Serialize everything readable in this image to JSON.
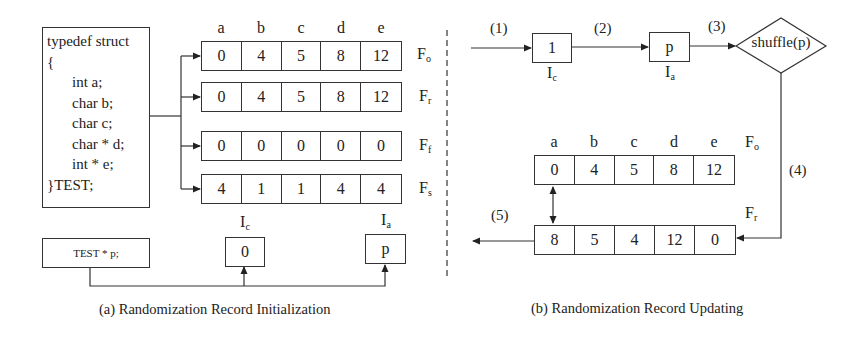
{
  "panel_a": {
    "struct_code": [
      "typedef struct",
      "{",
      "int a;",
      "char b;",
      "char c;",
      "char * d;",
      "int * e;",
      "}TEST;"
    ],
    "column_labels": [
      "a",
      "b",
      "c",
      "d",
      "e"
    ],
    "records": [
      {
        "name": "F",
        "sub": "o",
        "values": [
          "0",
          "4",
          "5",
          "8",
          "12"
        ]
      },
      {
        "name": "F",
        "sub": "r",
        "values": [
          "0",
          "4",
          "5",
          "8",
          "12"
        ]
      },
      {
        "name": "F",
        "sub": "f",
        "values": [
          "0",
          "0",
          "0",
          "0",
          "0"
        ]
      },
      {
        "name": "F",
        "sub": "s",
        "values": [
          "4",
          "1",
          "1",
          "4",
          "4"
        ]
      }
    ],
    "pointer_decl": "TEST * p;",
    "ic": {
      "name": "I",
      "sub": "c",
      "value": "0"
    },
    "ia": {
      "name": "I",
      "sub": "a",
      "value": "p"
    },
    "caption": "(a) Randomization Record Initialization"
  },
  "panel_b": {
    "steps": [
      "(1)",
      "(2)",
      "(3)",
      "(4)",
      "(5)"
    ],
    "ic": {
      "name": "I",
      "sub": "c",
      "value": "1"
    },
    "ia": {
      "name": "I",
      "sub": "a",
      "value": "p"
    },
    "shuffle_label": "shuffle(p)",
    "column_labels": [
      "a",
      "b",
      "c",
      "d",
      "e"
    ],
    "fo": {
      "name": "F",
      "sub": "o",
      "values": [
        "0",
        "4",
        "5",
        "8",
        "12"
      ]
    },
    "fr": {
      "name": "F",
      "sub": "r",
      "values": [
        "8",
        "5",
        "4",
        "12",
        "0"
      ]
    },
    "caption": "(b) Randomization Record Updating"
  }
}
